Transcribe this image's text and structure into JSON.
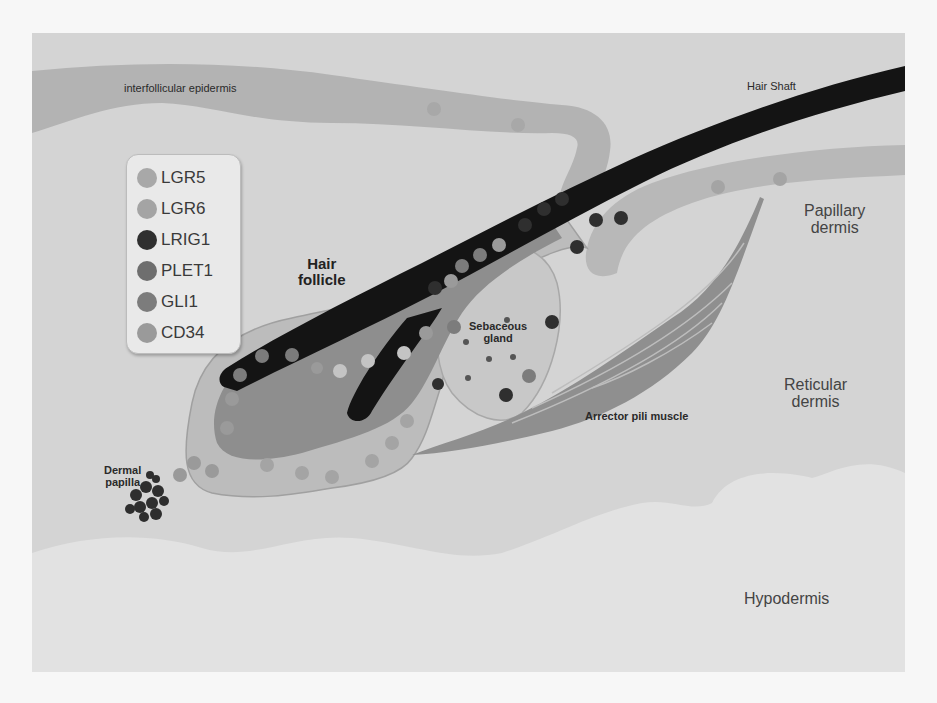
{
  "figure": {
    "colors": {
      "dermis_background": "#d4d4d4",
      "hypodermis": "#e2e2e2",
      "epidermis": "#b3b3b3",
      "hair_shaft": "#141414",
      "outer_root_sheath": "#bcbcbc",
      "inner_sheath": "#8e8e8e",
      "sebaceous_gland": "#c8c8c8",
      "muscle": "#8f8f8f",
      "dermal_papilla": "#2e2e2e"
    },
    "labels": {
      "interfollicular_epidermis": "interfollicular epidermis",
      "hair_shaft": "Hair Shaft",
      "papillary_dermis_line1": "Papillary",
      "papillary_dermis_line2": "dermis",
      "hair_follicle_line1": "Hair",
      "hair_follicle_line2": "follicle",
      "sebaceous_gland_line1": "Sebaceous",
      "sebaceous_gland_line2": "gland",
      "reticular_dermis_line1": "Reticular",
      "reticular_dermis_line2": "dermis",
      "arrector_pili_muscle": "Arrector pili muscle",
      "dermal_papilla_line1": "Dermal",
      "dermal_papilla_line2": "papilla",
      "hypodermis": "Hypodermis"
    }
  },
  "legend": {
    "items": [
      {
        "label": "LGR5",
        "color": "#a8a8a8"
      },
      {
        "label": "LGR6",
        "color": "#a4a4a4"
      },
      {
        "label": "LRIG1",
        "color": "#2f2f2f"
      },
      {
        "label": "PLET1",
        "color": "#6e6e6e"
      },
      {
        "label": "GLI1",
        "color": "#7c7c7c"
      },
      {
        "label": "CD34",
        "color": "#9a9a9a"
      }
    ]
  }
}
